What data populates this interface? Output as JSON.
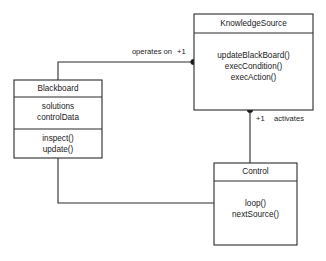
{
  "diagram": {
    "type": "uml-class-diagram",
    "background_color": "#ffffff",
    "line_color": "#2b2b2b",
    "text_color": "#1a1a1a"
  },
  "classes": [
    {
      "id": "knowledgesource",
      "name": "KnowledgeSource",
      "attributes": [],
      "operations": [
        "updateBlackBoard()",
        "execCondition()",
        "execAction()"
      ]
    },
    {
      "id": "blackboard",
      "name": "Blackboard",
      "attributes": [
        "solutions",
        "controlData"
      ],
      "operations": [
        "inspect()",
        "update()"
      ]
    },
    {
      "id": "control",
      "name": "Control",
      "attributes": [],
      "operations": [
        "loop()",
        "nextSource()"
      ]
    }
  ],
  "associations": [
    {
      "id": "blackboard-knowledgesource",
      "from": "blackboard",
      "to": "knowledgesource",
      "label": "operates on",
      "multiplicity": "+1"
    },
    {
      "id": "knowledgesource-control",
      "from": "control",
      "to": "knowledgesource",
      "label": "activates",
      "multiplicity": "+1"
    },
    {
      "id": "blackboard-control",
      "from": "blackboard",
      "to": "control",
      "label": "",
      "multiplicity": ""
    }
  ]
}
